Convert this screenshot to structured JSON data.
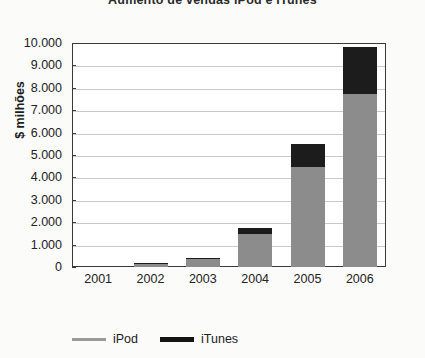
{
  "chart_data": {
    "type": "bar",
    "stacked": true,
    "title": "Aumento de vendas iPod e iTunes",
    "xlabel": "",
    "ylabel": "$ milhões",
    "categories": [
      "2001",
      "2002",
      "2003",
      "2004",
      "2005",
      "2006"
    ],
    "series": [
      {
        "name": "iPod",
        "color": "#8c8c8c",
        "values": [
          0,
          140,
          390,
          1470,
          4460,
          7720
        ]
      },
      {
        "name": "iTunes",
        "color": "#1c1c1c",
        "values": [
          0,
          20,
          30,
          270,
          1030,
          2100
        ]
      }
    ],
    "totals": [
      0,
      160,
      420,
      1740,
      5490,
      9820
    ],
    "ylim": [
      0,
      10000
    ],
    "y_ticks": [
      "0",
      "1.000",
      "2.000",
      "3.000",
      "4.000",
      "5.000",
      "6.000",
      "7.000",
      "8.000",
      "9.000",
      "10.000"
    ],
    "y_tick_values": [
      0,
      1000,
      2000,
      3000,
      4000,
      5000,
      6000,
      7000,
      8000,
      9000,
      10000
    ],
    "grid": true,
    "legend_position": "bottom"
  },
  "legend": {
    "entries": [
      {
        "label": "iPod"
      },
      {
        "label": "iTunes"
      }
    ]
  }
}
